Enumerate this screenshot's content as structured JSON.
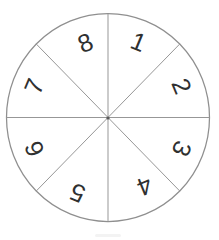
{
  "figure": {
    "type": "spinner-wheel",
    "sector_count": 8,
    "sectors": [
      {
        "label": "1",
        "mid_angle_deg": 22.5
      },
      {
        "label": "2",
        "mid_angle_deg": 67.5
      },
      {
        "label": "3",
        "mid_angle_deg": 112.5
      },
      {
        "label": "4",
        "mid_angle_deg": 157.5
      },
      {
        "label": "5",
        "mid_angle_deg": 202.5
      },
      {
        "label": "6",
        "mid_angle_deg": 247.5
      },
      {
        "label": "7",
        "mid_angle_deg": 292.5
      },
      {
        "label": "8",
        "mid_angle_deg": 337.5
      }
    ],
    "colors": {
      "background": "#ffffff",
      "outline": "#8f8f8f",
      "divider": "#979797",
      "center_dot": "#5a5a5a",
      "label": "#2f3030",
      "scan_artifact": "#f3f3f3"
    }
  }
}
